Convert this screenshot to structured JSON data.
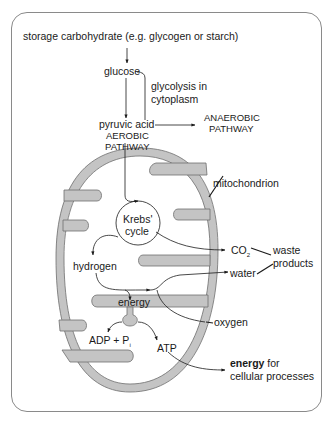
{
  "diagram": {
    "labels": {
      "storage": "storage carbohydrate (e.g. glycogen or starch)",
      "glucose": "glucose",
      "glycolysis_line1": "glycolysis in",
      "glycolysis_line2": "cytoplasm",
      "pyruvic": "pyruvic acid",
      "aerobic_line1": "AEROBIC",
      "aerobic_line2": "PATHWAY",
      "anaerobic_line1": "ANAEROBIC",
      "anaerobic_line2": "PATHWAY",
      "mitochondrion": "mitochondrion",
      "krebs_line1": "Krebs'",
      "krebs_line2": "cycle",
      "co2": "CO",
      "co2_sub": "2",
      "waste_line1": "waste",
      "waste_line2": "products",
      "hydrogen": "hydrogen",
      "water": "water",
      "energy": "energy",
      "oxygen": "oxygen",
      "adp": "ADP + P",
      "adp_sub": "i",
      "atp": "ATP",
      "energy_for_bold": "energy",
      "energy_for_rest": " for",
      "cellular": "cellular processes"
    },
    "colors": {
      "membrane_fill": "#c4c4c4",
      "membrane_stroke": "#6e6e6e",
      "frame_border": "#8a8a8a",
      "text": "#1a1a1a"
    }
  }
}
